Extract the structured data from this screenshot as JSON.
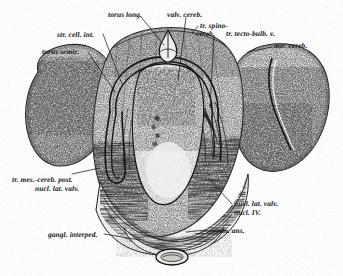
{
  "figure": {
    "type": "anatomical-histological-section",
    "background_color": "#fefefe",
    "ink_color": "#1a1a1a",
    "width": 343,
    "height": 276
  },
  "labels": [
    {
      "id": "torus-long",
      "text": "torus long.",
      "x": 108,
      "y": 11,
      "align": "left"
    },
    {
      "id": "valv-cereb",
      "text": "valv. cereb.",
      "x": 167,
      "y": 11,
      "align": "left"
    },
    {
      "id": "tr-spino-cereb",
      "text": "tr. spino-",
      "x": 200,
      "y": 24,
      "align": "left"
    },
    {
      "id": "tr-spino-cereb-2",
      "text": "cereb.",
      "x": 197,
      "y": 32,
      "align": "left"
    },
    {
      "id": "tr-tecto-bulb-v",
      "text": "tr. tecto-bulb. v.",
      "x": 225,
      "y": 32,
      "align": "left"
    },
    {
      "id": "str-cell-int",
      "text": "str. cell. int.",
      "x": 57,
      "y": 31,
      "align": "left"
    },
    {
      "id": "aur-cereb",
      "text": "aur. cereb.",
      "x": 274,
      "y": 43,
      "align": "left"
    },
    {
      "id": "torus-semic",
      "text": "torus semic.",
      "x": 42,
      "y": 48,
      "align": "left"
    },
    {
      "id": "tr-mes-cereb-post",
      "text": "tr. mes.-cereb. post.",
      "x": 12,
      "y": 175,
      "align": "left"
    },
    {
      "id": "nucl-lat-valv-left",
      "text": "nucl. lat. valv.",
      "x": 34,
      "y": 184,
      "align": "left"
    },
    {
      "id": "nucl-lat-valv-right",
      "text": "nucl. lat. valv.",
      "x": 234,
      "y": 200,
      "align": "left"
    },
    {
      "id": "nucl-iv",
      "text": "nucl. IV.",
      "x": 234,
      "y": 209,
      "align": "left"
    },
    {
      "id": "comm-ans",
      "text": "comm. ans.",
      "x": 208,
      "y": 227,
      "align": "left"
    },
    {
      "id": "gangl-interped",
      "text": "gangl. interped.",
      "x": 48,
      "y": 231,
      "align": "left"
    }
  ],
  "structures": [
    {
      "id": "torus-semicircularis-left",
      "name": "left torus semicircularis lobe"
    },
    {
      "id": "torus-semicircularis-right",
      "name": "right torus semicircularis lobe"
    },
    {
      "id": "valvula-cerebelli",
      "name": "valvula cerebelli (central)"
    },
    {
      "id": "ventricle",
      "name": "ventricular cavity"
    },
    {
      "id": "commissura-ansulata",
      "name": "commissura ansulata (ventral band)"
    },
    {
      "id": "ganglion-interpedunculare",
      "name": "ganglion interpedunculare"
    },
    {
      "id": "detached-oval",
      "name": "small detached ventral oval body"
    }
  ]
}
